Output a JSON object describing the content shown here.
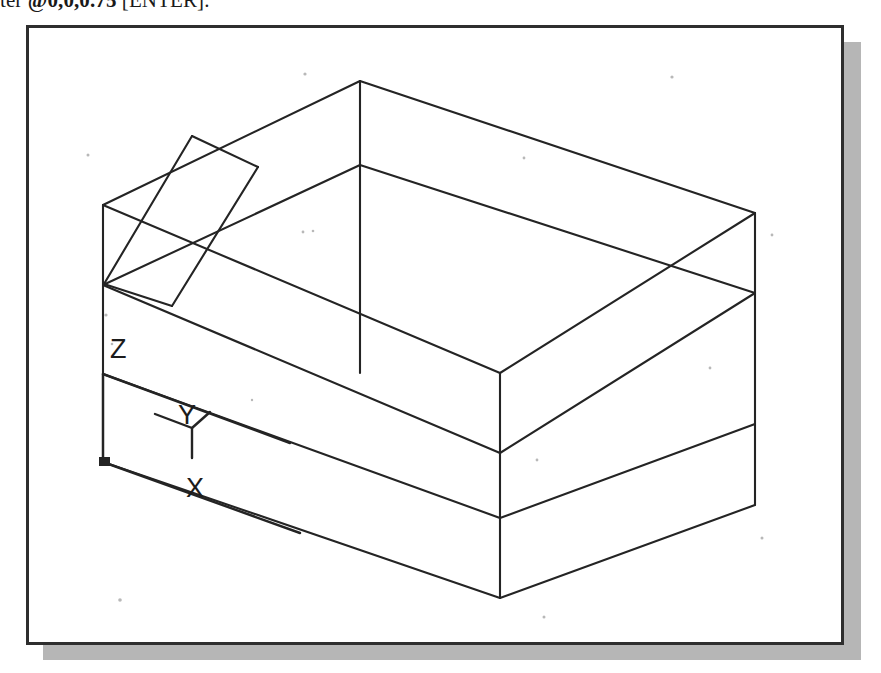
{
  "caption": {
    "prefix": "ter ",
    "command": "@0,0,0.75",
    "suffix": " [ENTER]."
  },
  "drawing": {
    "title": "autocad-isometric-wireframe",
    "background_color": "#ffffff",
    "line_color": "#242424",
    "frame_color": "#2e2e2e",
    "shadow_color": "#a9a9a9"
  },
  "ucs_icon": {
    "name": "ucs-coordinate-icon",
    "origin": {
      "x": 103,
      "y": 462
    },
    "axes": [
      {
        "label": "X",
        "label_x": 196,
        "label_y": 459,
        "tip_x": 300,
        "tip_y": 500
      },
      {
        "label": "Y",
        "label_x": 181,
        "label_y": 414,
        "tip_x": 290,
        "tip_y": 363
      },
      {
        "label": "Z",
        "label_x": 118,
        "label_y": 356,
        "tip_x": 103,
        "tip_y": 374
      }
    ]
  },
  "geometry": {
    "description": "Isometric wireframe box with a rectangular slot cut in the top face",
    "vertices": {
      "top_back": {
        "x": 360,
        "y": 81
      },
      "top_left": {
        "x": 103,
        "y": 205
      },
      "top_right": {
        "x": 755,
        "y": 213
      },
      "top_front": {
        "x": 500,
        "y": 373
      },
      "upper_mid_left": {
        "x": 103,
        "y": 285
      },
      "upper_mid_front": {
        "x": 500,
        "y": 453
      },
      "upper_mid_right": {
        "x": 755,
        "y": 293
      },
      "mid_left": {
        "x": 103,
        "y": 374
      },
      "mid_front": {
        "x": 500,
        "y": 518
      },
      "mid_right": {
        "x": 755,
        "y": 424
      },
      "bottom_left": {
        "x": 103,
        "y": 462
      },
      "bottom_front": {
        "x": 500,
        "y": 598
      },
      "bottom_right": {
        "x": 755,
        "y": 505
      },
      "back_lower": {
        "x": 360,
        "y": 373
      }
    },
    "slot": {
      "corner_top": {
        "x": 192,
        "y": 136
      },
      "corner_right": {
        "x": 258,
        "y": 167
      },
      "corner_bottom": {
        "x": 172,
        "y": 306
      },
      "corner_left": {
        "x": 104,
        "y": 284
      }
    }
  }
}
